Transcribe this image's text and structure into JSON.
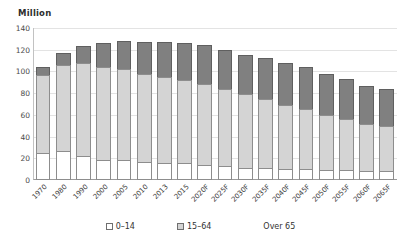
{
  "unit_label": "Million",
  "colors": {
    "young": "#ffffff",
    "working": "#d4d4d4",
    "over65": "#808080",
    "gridline": "#e3e3e3",
    "axis": "#9a9a9a"
  },
  "legend": {
    "items": [
      {
        "label": "0–14",
        "swatch": "young"
      },
      {
        "label": "15–64",
        "swatch": "working"
      },
      {
        "label": "Over 65",
        "swatch": "over65"
      }
    ]
  },
  "chart_data": {
    "type": "bar",
    "stacked": true,
    "title": "",
    "subtitle": "",
    "xlabel": "",
    "ylabel": "Million",
    "ylim": [
      0,
      140
    ],
    "yticks": [
      0,
      20,
      40,
      60,
      80,
      100,
      120,
      140
    ],
    "grid": true,
    "legend_position": "bottom",
    "categories": [
      "1970",
      "1980",
      "1990",
      "2000",
      "2005",
      "2010",
      "2013",
      "2015",
      "2020F",
      "2025F",
      "2030F",
      "2035F",
      "2040F",
      "2045F",
      "2050F",
      "2055F",
      "2060F",
      "2065F"
    ],
    "series": [
      {
        "name": "0–14",
        "values": [
          25,
          27,
          22,
          18,
          18,
          17,
          16,
          16,
          14,
          13,
          11,
          11,
          10,
          10,
          9,
          9,
          8,
          8
        ]
      },
      {
        "name": "15–64",
        "values": [
          72,
          79,
          86,
          86,
          84,
          81,
          79,
          76,
          74,
          71,
          68,
          64,
          59,
          55,
          51,
          47,
          44,
          42
        ]
      },
      {
        "name": "Over 65",
        "values": [
          7,
          11,
          15,
          22,
          26,
          29,
          32,
          34,
          36,
          36,
          36,
          37,
          39,
          39,
          38,
          37,
          35,
          34
        ]
      }
    ],
    "totals": [
      104,
      117,
      123,
      126,
      128,
      127,
      127,
      126,
      124,
      120,
      115,
      112,
      108,
      104,
      98,
      93,
      87,
      84
    ]
  }
}
